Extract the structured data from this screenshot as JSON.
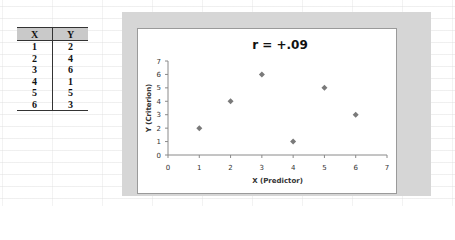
{
  "table": {
    "headers": [
      "X",
      "Y"
    ],
    "rows": [
      [
        "1",
        "2"
      ],
      [
        "2",
        "4"
      ],
      [
        "3",
        "6"
      ],
      [
        "4",
        "1"
      ],
      [
        "5",
        "5"
      ],
      [
        "6",
        "3"
      ]
    ]
  },
  "chart": {
    "title": "r  =  +.09",
    "xlabel": "X (Predictor)",
    "ylabel": "Y (Criterion)",
    "x_ticks": [
      "0",
      "1",
      "2",
      "3",
      "4",
      "5",
      "6",
      "7"
    ],
    "y_ticks": [
      "0",
      "1",
      "2",
      "3",
      "4",
      "5",
      "6",
      "7"
    ],
    "marker_color": "#7a7a7a"
  },
  "chart_data": {
    "type": "scatter",
    "title": "r = +.09",
    "xlabel": "X (Predictor)",
    "ylabel": "Y (Criterion)",
    "x": [
      1,
      2,
      3,
      4,
      5,
      6
    ],
    "y": [
      2,
      4,
      6,
      1,
      5,
      3
    ],
    "xlim": [
      0,
      7
    ],
    "ylim": [
      0,
      7
    ],
    "x_ticks": [
      0,
      1,
      2,
      3,
      4,
      5,
      6,
      7
    ],
    "y_ticks": [
      0,
      1,
      2,
      3,
      4,
      5,
      6,
      7
    ],
    "grid": false,
    "legend": null,
    "marker": "diamond"
  }
}
